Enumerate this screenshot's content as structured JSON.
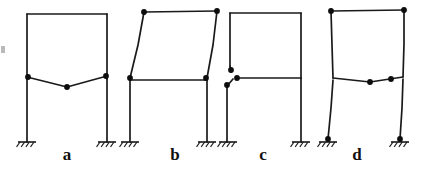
{
  "figure": {
    "background_color": "#ffffff",
    "line_color": "#1a1a1a",
    "node_color": "#0d0d0d",
    "width": 424,
    "height": 169,
    "node_radius": 2.9,
    "label_font_size": 17
  },
  "support": {
    "type": "fixed-support",
    "base_half_width": 9,
    "hatch_count": 4,
    "hatch_length": 6,
    "hatch_angle_deg": 55
  },
  "frames": [
    {
      "id": "frame-a",
      "label": "a",
      "label_x": 67,
      "label_y": 160,
      "description": "Mid-level beam deflects downward (sagging) while columns and roof stay straight",
      "mode": "beam-sagging",
      "supports": [
        {
          "x": 27,
          "y": 142
        },
        {
          "x": 107,
          "y": 142
        }
      ],
      "members": [
        {
          "name": "left-column-lower",
          "points": "27,142 27,79"
        },
        {
          "name": "left-column-upper",
          "points": "27,79 27,14"
        },
        {
          "name": "right-column-lower",
          "points": "107,142 107,79"
        },
        {
          "name": "right-column-upper",
          "points": "107,79 107,14"
        },
        {
          "name": "roof-beam",
          "points": "27,14 107,14"
        },
        {
          "name": "mid-beam-deformed",
          "points": "27,77 67,87 107,76"
        }
      ],
      "nodes": [
        {
          "name": "node-mid-left",
          "x": 28,
          "y": 77
        },
        {
          "name": "node-mid-center",
          "x": 67,
          "y": 87
        },
        {
          "name": "node-mid-right",
          "x": 106,
          "y": 76
        }
      ]
    },
    {
      "id": "frame-b",
      "label": "b",
      "label_x": 175,
      "label_y": 160,
      "description": "Upper story sways to the right; lower story remains undeformed",
      "mode": "upper-story-sidesway",
      "supports": [
        {
          "x": 130,
          "y": 142
        },
        {
          "x": 207,
          "y": 142
        }
      ],
      "members": [
        {
          "name": "left-column-lower",
          "points": "130,142 130,80"
        },
        {
          "name": "right-column-lower",
          "points": "207,142 207,80"
        },
        {
          "name": "mid-beam",
          "points": "130,80 207,80"
        },
        {
          "name": "left-column-upper-deformed",
          "points": "130,78 138,45 144,12"
        },
        {
          "name": "right-column-upper-deformed",
          "points": "207,78 213,45 217,11"
        },
        {
          "name": "roof-beam-deformed",
          "points": "144,12 217,11"
        }
      ],
      "nodes": [
        {
          "name": "node-mid-left",
          "x": 130,
          "y": 78
        },
        {
          "name": "node-mid-right",
          "x": 206,
          "y": 78
        },
        {
          "name": "node-top-left",
          "x": 144,
          "y": 12
        },
        {
          "name": "node-top-right",
          "x": 217,
          "y": 11
        }
      ]
    },
    {
      "id": "frame-c",
      "label": "c",
      "label_x": 263,
      "label_y": 160,
      "description": "Local joint deformation at the left mid-level joint; rest of frame undeformed",
      "mode": "local-joint-rotation",
      "supports": [
        {
          "x": 228,
          "y": 142
        },
        {
          "x": 301,
          "y": 142
        }
      ],
      "members": [
        {
          "name": "left-column-lower",
          "points": "227,142 227,86"
        },
        {
          "name": "left-column-kink-lower",
          "points": "227,86 233,79"
        },
        {
          "name": "left-column-kink-upper",
          "points": "231,72 230,66"
        },
        {
          "name": "left-column-upper",
          "points": "230,66 230,13"
        },
        {
          "name": "right-column-lower",
          "points": "301,142 301,78"
        },
        {
          "name": "right-column-upper",
          "points": "301,78 301,13"
        },
        {
          "name": "roof-beam",
          "points": "230,13 301,13"
        },
        {
          "name": "mid-beam",
          "points": "236,78 301,78"
        }
      ],
      "nodes": [
        {
          "name": "node-joint-upper",
          "x": 231,
          "y": 70
        },
        {
          "name": "node-joint-beam",
          "x": 237,
          "y": 78
        },
        {
          "name": "node-joint-lower",
          "x": 227,
          "y": 85
        }
      ]
    },
    {
      "id": "frame-d",
      "label": "d",
      "label_x": 357,
      "label_y": 160,
      "description": "Whole frame sways: both stories lean and the mid-level beam sags slightly",
      "mode": "full-frame-sidesway",
      "supports": [
        {
          "x": 328,
          "y": 142
        },
        {
          "x": 400,
          "y": 142
        }
      ],
      "members": [
        {
          "name": "left-column-lower-deformed",
          "points": "328,139 331,108 333,80"
        },
        {
          "name": "left-column-upper-deformed",
          "points": "333,78 332,45 331,11"
        },
        {
          "name": "right-column-lower-deformed",
          "points": "400,139 402,108 403,79"
        },
        {
          "name": "right-column-upper-deformed",
          "points": "403,77 404,44 404,10"
        },
        {
          "name": "roof-beam-deformed",
          "points": "331,11 404,10"
        },
        {
          "name": "mid-beam-deformed",
          "points": "333,78 370,82 403,77"
        }
      ],
      "nodes": [
        {
          "name": "node-base-left",
          "x": 328,
          "y": 139
        },
        {
          "name": "node-base-right",
          "x": 400,
          "y": 139
        },
        {
          "name": "node-mid-center",
          "x": 370,
          "y": 82
        },
        {
          "name": "node-mid-right",
          "x": 391,
          "y": 79
        },
        {
          "name": "node-top-left",
          "x": 331,
          "y": 11
        },
        {
          "name": "node-top-right",
          "x": 404,
          "y": 10
        }
      ]
    }
  ],
  "artifacts": [
    {
      "name": "scan-speck-left-edge",
      "x": 1,
      "y": 46,
      "width": 4,
      "height": 7
    }
  ]
}
